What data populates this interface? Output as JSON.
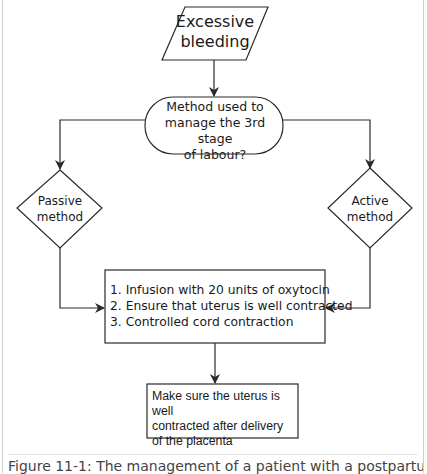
{
  "flowchart": {
    "start": {
      "line1": "Excessive",
      "line2": "bleeding"
    },
    "decision": {
      "line1": "Method used to",
      "line2": "manage the 3rd stage",
      "line3": "of labour?"
    },
    "passive": {
      "line1": "Passive",
      "line2": "method"
    },
    "active": {
      "line1": "Active",
      "line2": "method"
    },
    "steps": [
      "1. Infusion with 20 units of oxytocin",
      "2. Ensure that uterus is well contracted",
      "3. Controlled cord contraction"
    ],
    "final": {
      "line1": "Make sure the uterus is well",
      "line2": "contracted after delivery",
      "line3": "of the placenta"
    }
  },
  "caption": "Figure 11-1: The management of a patient with a postpartum",
  "colors": {
    "stroke": "#2a2a2a",
    "text": "#1a1a1a",
    "caption": "#444444",
    "frame": "#cfcfcf"
  }
}
